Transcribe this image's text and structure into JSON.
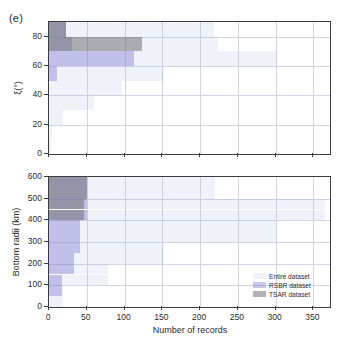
{
  "panel_label": "(e)",
  "legend": {
    "position": "bottom-right",
    "items": [
      {
        "label": "Entire dataset",
        "color": "#a0b9dc",
        "key": "entire"
      },
      {
        "label": "RSBR dataset",
        "color": "#817ad2",
        "key": "rsbr"
      },
      {
        "label": "TSAR dataset",
        "color": "#6c6c70",
        "key": "tsar"
      }
    ]
  },
  "shared_x": {
    "label": "Number of records",
    "ticks": [
      0,
      50,
      100,
      150,
      200,
      250,
      300,
      350
    ],
    "range": [
      0,
      372
    ]
  },
  "chart_data": [
    {
      "type": "bar",
      "orientation": "horizontal",
      "id": "xi-histogram",
      "title": "",
      "xlabel": "Number of records",
      "ylabel": "ξ(°)",
      "xlim": [
        0,
        372
      ],
      "ylim": [
        0,
        90
      ],
      "xticks": [
        0,
        50,
        100,
        150,
        200,
        250,
        300,
        350
      ],
      "yticks": [
        0,
        20,
        40,
        60,
        80
      ],
      "grid": true,
      "bin_width": 10,
      "bin_starts": [
        0,
        10,
        20,
        30,
        40,
        50,
        60,
        70,
        80
      ],
      "bin_labels": [
        "0-10",
        "10-20",
        "20-30",
        "30-40",
        "40-50",
        "50-60",
        "60-70",
        "70-80",
        "80-90"
      ],
      "series": [
        {
          "name": "Entire dataset",
          "color": "#a0b9dc",
          "values": [
            2,
            4,
            18,
            60,
            96,
            152,
            302,
            224,
            218
          ]
        },
        {
          "name": "RSBR dataset",
          "color": "#817ad2",
          "values": [
            0,
            0,
            0,
            0,
            0,
            10,
            112,
            30,
            22
          ]
        },
        {
          "name": "TSAR dataset",
          "color": "#6c6c70",
          "values": [
            0,
            0,
            0,
            0,
            0,
            0,
            0,
            123,
            23
          ]
        }
      ]
    },
    {
      "type": "bar",
      "orientation": "horizontal",
      "id": "bottom-radii-histogram",
      "title": "",
      "xlabel": "Number of records",
      "ylabel": "Bottom radii (km)",
      "xlim": [
        0,
        372
      ],
      "ylim": [
        0,
        600
      ],
      "xticks": [
        0,
        50,
        100,
        150,
        200,
        250,
        300,
        350
      ],
      "yticks": [
        0,
        100,
        200,
        300,
        400,
        500,
        600
      ],
      "grid": true,
      "bin_width": 50,
      "bin_starts": [
        0,
        50,
        100,
        150,
        200,
        250,
        300,
        350,
        400,
        450,
        500,
        550
      ],
      "bin_labels": [
        "0-50",
        "50-100",
        "100-150",
        "150-200",
        "200-250",
        "250-300",
        "300-350",
        "350-400",
        "400-450",
        "450-500",
        "500-550",
        "550-600"
      ],
      "series": [
        {
          "name": "Entire dataset",
          "color": "#a0b9dc",
          "values": [
            18,
            18,
            78,
            78,
            152,
            152,
            300,
            300,
            365,
            365,
            220,
            220
          ]
        },
        {
          "name": "RSBR dataset",
          "color": "#817ad2",
          "values": [
            0,
            17,
            17,
            33,
            33,
            41,
            41,
            41,
            50,
            50,
            50,
            50
          ]
        },
        {
          "name": "TSAR dataset",
          "color": "#6c6c70",
          "values": [
            0,
            0,
            0,
            0,
            0,
            0,
            0,
            0,
            46,
            46,
            50,
            50
          ]
        }
      ]
    }
  ]
}
